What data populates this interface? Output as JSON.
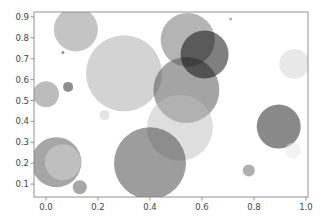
{
  "chart_data": {
    "type": "scatter",
    "title": "",
    "xlabel": "",
    "ylabel": "",
    "xlim": [
      -0.045,
      1.0
    ],
    "ylim": [
      0.04,
      0.93
    ],
    "grid": false,
    "legend": null,
    "xticks": [
      0.0,
      0.2,
      0.4,
      0.6,
      0.8,
      1.0
    ],
    "xtick_labels": [
      "0.0",
      "0.2",
      "0.4",
      "0.6",
      "0.8",
      "1.0"
    ],
    "yticks": [
      0.1,
      0.2,
      0.3,
      0.4,
      0.5,
      0.6,
      0.7,
      0.8,
      0.9
    ],
    "ytick_labels": [
      "0.1",
      "0.2",
      "0.3",
      "0.4",
      "0.5",
      "0.6",
      "0.7",
      "0.8",
      "0.9"
    ],
    "colormap": "gray",
    "alpha": 0.5,
    "points": [
      {
        "x": 0.115,
        "y": 0.84,
        "r": 22,
        "color": "#8a8a8a"
      },
      {
        "x": 0.065,
        "y": 0.73,
        "r": 1.5,
        "color": "#222222"
      },
      {
        "x": 0.0,
        "y": 0.53,
        "r": 13,
        "color": "#7a7a7a"
      },
      {
        "x": 0.085,
        "y": 0.565,
        "r": 5,
        "color": "#1e1e1e"
      },
      {
        "x": 0.3,
        "y": 0.63,
        "r": 38,
        "color": "#a8a8a8"
      },
      {
        "x": 0.545,
        "y": 0.79,
        "r": 27,
        "color": "#6a6a6a"
      },
      {
        "x": 0.54,
        "y": 0.55,
        "r": 33,
        "color": "#4a4a4a"
      },
      {
        "x": 0.61,
        "y": 0.72,
        "r": 24,
        "color": "#000000"
      },
      {
        "x": 0.515,
        "y": 0.37,
        "r": 33,
        "color": "#bdbdbd"
      },
      {
        "x": 0.4,
        "y": 0.2,
        "r": 36,
        "color": "#3c3c3c"
      },
      {
        "x": 0.225,
        "y": 0.43,
        "r": 5,
        "color": "#c8c8c8"
      },
      {
        "x": 0.04,
        "y": 0.205,
        "r": 25,
        "color": "#4e4e4e"
      },
      {
        "x": 0.065,
        "y": 0.205,
        "r": 18,
        "color": "#d8d8d8"
      },
      {
        "x": 0.13,
        "y": 0.085,
        "r": 7,
        "color": "#505050"
      },
      {
        "x": 0.955,
        "y": 0.675,
        "r": 15,
        "color": "#d2d2d2"
      },
      {
        "x": 0.895,
        "y": 0.375,
        "r": 22,
        "color": "#141414"
      },
      {
        "x": 0.95,
        "y": 0.26,
        "r": 8,
        "color": "#e6e6e6"
      },
      {
        "x": 0.78,
        "y": 0.165,
        "r": 6,
        "color": "#606060"
      },
      {
        "x": 0.71,
        "y": 0.89,
        "r": 1.5,
        "color": "#606060"
      }
    ]
  },
  "layout": {
    "axes_left": 34,
    "axes_top": 12,
    "axes_right": 308,
    "axes_bottom": 197,
    "x0_px": 46,
    "x_scale": 260,
    "y0_px": 205,
    "y_scale": 209
  }
}
